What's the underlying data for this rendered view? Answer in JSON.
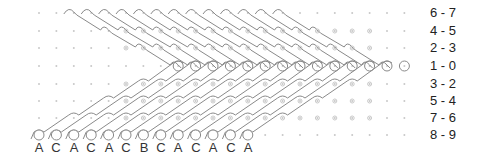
{
  "diagram": {
    "title": "",
    "grid": {
      "x0": 39,
      "dx": 17.4,
      "cols": 22,
      "rows_y": [
        13,
        31,
        48,
        66,
        84,
        101,
        118,
        135
      ]
    },
    "row_labels": [
      "6 - 7",
      "4 - 5",
      "2 - 3",
      "1 - 0",
      "3 - 2",
      "5 - 4",
      "7 - 6",
      "8 - 9"
    ],
    "base_labels": [
      "A",
      "C",
      "A",
      "C",
      "A",
      "C",
      "B",
      "C",
      "A",
      "C",
      "A",
      "C",
      "A"
    ],
    "colors": {
      "line": "#8a8a8a",
      "dot": "#c8c8c8",
      "text": "#222222"
    }
  }
}
